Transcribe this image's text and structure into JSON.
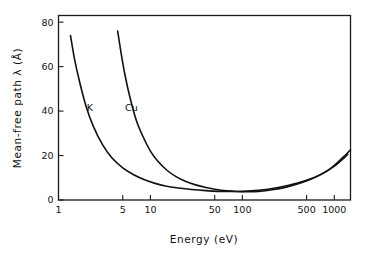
{
  "chart_data": {
    "type": "line",
    "title": "",
    "xlabel": "Energy (eV)",
    "ylabel": "Mean-free path λ  (Å)",
    "xscale": "log",
    "yscale": "linear",
    "xlim": [
      1,
      1500
    ],
    "ylim": [
      0,
      83
    ],
    "grid": false,
    "legend_position": "inline-curve-labels",
    "xticks": [
      {
        "value": 1,
        "label": "1"
      },
      {
        "value": 5,
        "label": "5"
      },
      {
        "value": 10,
        "label": "10"
      },
      {
        "value": 50,
        "label": "50"
      },
      {
        "value": 100,
        "label": "100"
      },
      {
        "value": 500,
        "label": "500"
      },
      {
        "value": 1000,
        "label": "1000"
      }
    ],
    "yticks": [
      {
        "value": 0,
        "label": "0"
      },
      {
        "value": 20,
        "label": "20"
      },
      {
        "value": 40,
        "label": "40"
      },
      {
        "value": 60,
        "label": "60"
      },
      {
        "value": 80,
        "label": "80"
      }
    ],
    "series": [
      {
        "name": "K",
        "label": "K",
        "label_x": 2.2,
        "label_y": 40,
        "color": "#111111",
        "x": [
          1.35,
          1.5,
          1.7,
          2.0,
          2.4,
          3.0,
          3.8,
          5.0,
          6.5,
          8.5,
          11,
          15,
          20,
          28,
          40,
          55,
          75,
          100,
          150,
          220,
          320,
          480,
          700,
          1000,
          1400
        ],
        "y": [
          74,
          63,
          53,
          42,
          33,
          25,
          19,
          14.5,
          11.5,
          9.2,
          7.6,
          6.2,
          5.4,
          4.7,
          4.2,
          3.9,
          3.8,
          3.9,
          4.4,
          5.3,
          6.6,
          8.6,
          11.3,
          15.2,
          20.5
        ]
      },
      {
        "name": "Cu",
        "label": "Cu",
        "label_x": 6.2,
        "label_y": 40,
        "color": "#111111",
        "x": [
          4.4,
          4.8,
          5.3,
          6.0,
          7.0,
          8.2,
          10,
          12,
          15,
          19,
          24,
          31,
          40,
          52,
          68,
          88,
          115,
          150,
          210,
          300,
          430,
          620,
          900,
          1250,
          1500
        ],
        "y": [
          76,
          66,
          56,
          46,
          36,
          29,
          22,
          17.5,
          13.5,
          10.5,
          8.4,
          6.8,
          5.6,
          4.7,
          4.1,
          3.8,
          3.7,
          3.9,
          4.6,
          5.8,
          7.6,
          10.2,
          14.0,
          19.3,
          22.6
        ]
      }
    ]
  }
}
